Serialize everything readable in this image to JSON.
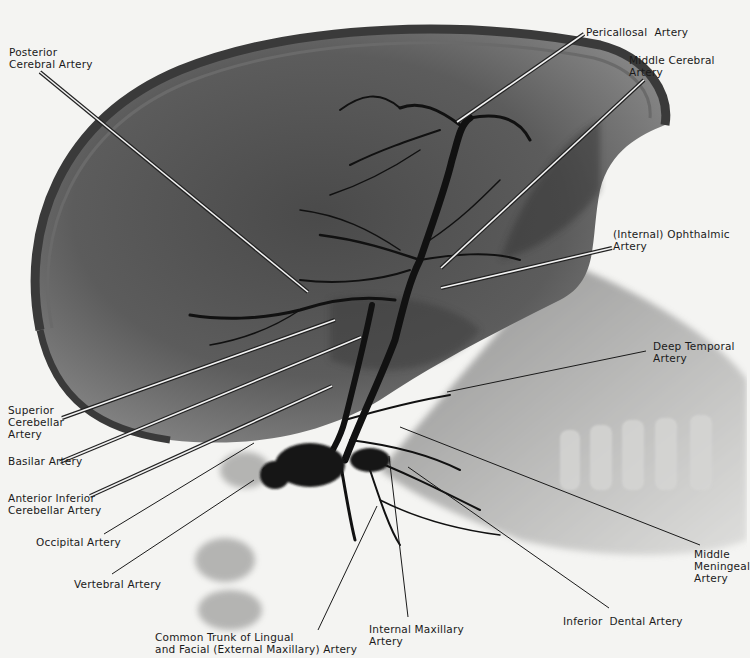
{
  "figure": {
    "type": "lateral cerebral angiogram (radiograph)",
    "background": "#f4f4f2"
  },
  "labels": [
    {
      "id": "posterior-cerebral",
      "text": "Posterior\nCerebral Artery",
      "x": 9,
      "y": 46,
      "line": [
        [
          40,
          72
        ],
        [
          308,
          292
        ]
      ],
      "double": true
    },
    {
      "id": "pericallosal",
      "text": "Pericallosal  Artery",
      "x": 586,
      "y": 26,
      "line": [
        [
          584,
          34
        ],
        [
          457,
          122
        ]
      ],
      "double": true
    },
    {
      "id": "middle-cerebral",
      "text": "Middle Cerebral\nArtery",
      "x": 629,
      "y": 54,
      "line": [
        [
          644,
          80
        ],
        [
          441,
          268
        ]
      ],
      "double": true
    },
    {
      "id": "ophthalmic",
      "text": "(Internal) Ophthalmic\nArtery",
      "x": 613,
      "y": 228,
      "line": [
        [
          612,
          248
        ],
        [
          441,
          288
        ]
      ],
      "double": true
    },
    {
      "id": "deep-temporal",
      "text": "Deep Temporal\nArtery",
      "x": 653,
      "y": 340,
      "line": [
        [
          646,
          351
        ],
        [
          447,
          392
        ]
      ],
      "double": false
    },
    {
      "id": "superior-cerebellar",
      "text": "Superior\nCerebellar\nArtery",
      "x": 8,
      "y": 404,
      "line": [
        [
          62,
          418
        ],
        [
          335,
          320
        ]
      ],
      "double": true
    },
    {
      "id": "basilar",
      "text": "Basilar Artery",
      "x": 8,
      "y": 455,
      "line": [
        [
          60,
          462
        ],
        [
          361,
          337
        ]
      ],
      "double": true
    },
    {
      "id": "anterior-inferior-cerebellar",
      "text": "Anterior Inferior\nCerebellar Artery",
      "x": 8,
      "y": 492,
      "line": [
        [
          90,
          496
        ],
        [
          332,
          386
        ]
      ],
      "double": true
    },
    {
      "id": "occipital",
      "text": "Occipital Artery",
      "x": 36,
      "y": 536,
      "line": [
        [
          104,
          534
        ],
        [
          254,
          443
        ]
      ],
      "double": false
    },
    {
      "id": "vertebral",
      "text": "Vertebral Artery",
      "x": 74,
      "y": 578,
      "line": [
        [
          112,
          574
        ],
        [
          254,
          480
        ]
      ],
      "double": false
    },
    {
      "id": "common-trunk",
      "text": "Common Trunk of Lingual\nand Facial (External Maxillary) Artery",
      "x": 155,
      "y": 631,
      "line": [
        [
          318,
          630
        ],
        [
          377,
          506
        ]
      ],
      "double": false
    },
    {
      "id": "internal-maxillary",
      "text": "Internal Maxillary\nArtery",
      "x": 369,
      "y": 623,
      "line": [
        [
          408,
          617
        ],
        [
          389,
          456
        ]
      ],
      "double": false
    },
    {
      "id": "inferior-dental",
      "text": "Inferior  Dental Artery",
      "x": 563,
      "y": 615,
      "line": [
        [
          609,
          608
        ],
        [
          408,
          467
        ]
      ],
      "double": false
    },
    {
      "id": "middle-meningeal",
      "text": "Middle\nMeningeal\nArtery",
      "x": 694,
      "y": 548,
      "line": [
        [
          700,
          545
        ],
        [
          400,
          427
        ]
      ],
      "double": false
    }
  ]
}
